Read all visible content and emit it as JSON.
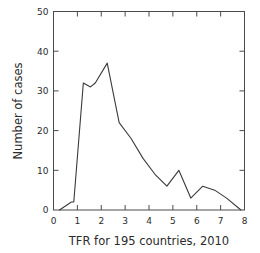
{
  "chart_data": {
    "type": "line",
    "title": "",
    "subtitle": "",
    "xlabel": "TFR for 195 countries, 2010",
    "ylabel": "Number of cases",
    "xlim": [
      0,
      8
    ],
    "ylim": [
      0,
      50
    ],
    "xticks": [
      0,
      1,
      2,
      3,
      4,
      5,
      6,
      7,
      8
    ],
    "xtick_labels": [
      "0",
      "1",
      "2",
      "3",
      "4",
      "5",
      "6",
      "7",
      "8"
    ],
    "yticks": [
      0,
      10,
      20,
      30,
      40,
      50
    ],
    "ytick_labels": [
      "0",
      "10",
      "20",
      "30",
      "40",
      "50"
    ],
    "grid": false,
    "legend": false,
    "legend_position": "none",
    "tick_direction": "in",
    "frame": "box",
    "line_color": "#3a3a3a",
    "axis_color": "#4a4a4a",
    "background_color": "#ffffff",
    "series": [
      {
        "name": "Number of cases",
        "x": [
          0.25,
          0.75,
          0.85,
          1.25,
          1.55,
          1.75,
          2.25,
          2.75,
          3.25,
          3.75,
          4.25,
          4.75,
          5.25,
          5.75,
          6.25,
          6.75,
          7.25,
          7.85
        ],
        "values": [
          0,
          2,
          2,
          32,
          31,
          32,
          37,
          22,
          18,
          13,
          9,
          6,
          10,
          3,
          6,
          5,
          3,
          0
        ]
      }
    ]
  }
}
